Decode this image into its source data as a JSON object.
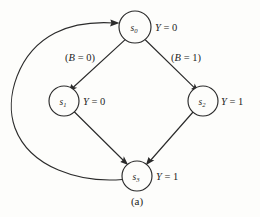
{
  "figure": {
    "caption": "(a)",
    "type": "state-transition-diagram",
    "background_color": "#fdfdfb",
    "ink_color": "#2b2b2b"
  },
  "states": [
    {
      "id": "s0",
      "base": "s",
      "subscript": "0",
      "output_var": "Y",
      "output_eq": " = ",
      "output_value": "0",
      "cx": 135,
      "cy": 27,
      "r": 16
    },
    {
      "id": "s1",
      "base": "s",
      "subscript": "1",
      "output_var": "Y",
      "output_eq": " = ",
      "output_value": "0",
      "cx": 64,
      "cy": 101,
      "r": 15
    },
    {
      "id": "s2",
      "base": "s",
      "subscript": "2",
      "output_var": "Y",
      "output_eq": " = ",
      "output_value": "1",
      "cx": 203,
      "cy": 101,
      "r": 15
    },
    {
      "id": "s3",
      "base": "s",
      "subscript": "3",
      "output_var": "Y",
      "output_eq": " = ",
      "output_value": "1",
      "cx": 137,
      "cy": 176,
      "r": 15
    }
  ],
  "transitions": [
    {
      "id": "s0-to-s1",
      "from": "s0",
      "to": "s1",
      "label_open": "(",
      "label_var": "B",
      "label_eq": " = ",
      "label_value": "0",
      "label_close": ")",
      "label_x": 80,
      "label_y": 57
    },
    {
      "id": "s0-to-s2",
      "from": "s0",
      "to": "s2",
      "label_open": "(",
      "label_var": "B",
      "label_eq": " = ",
      "label_value": "1",
      "label_close": ")",
      "label_x": 186,
      "label_y": 57
    },
    {
      "id": "s1-to-s3",
      "from": "s1",
      "to": "s3",
      "label_open": "",
      "label_var": "",
      "label_eq": "",
      "label_value": "",
      "label_close": ""
    },
    {
      "id": "s2-to-s3",
      "from": "s2",
      "to": "s3",
      "label_open": "",
      "label_var": "",
      "label_eq": "",
      "label_value": "",
      "label_close": ""
    },
    {
      "id": "s3-to-s0",
      "from": "s3",
      "to": "s0",
      "label_open": "",
      "label_var": "",
      "label_eq": "",
      "label_value": "",
      "label_close": ""
    }
  ]
}
